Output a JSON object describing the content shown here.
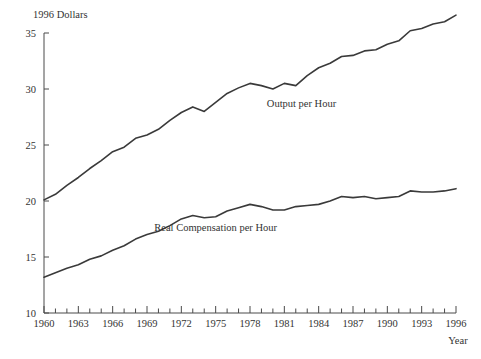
{
  "chart_data": {
    "type": "line",
    "title": "",
    "ylabel": "1996 Dollars",
    "xlabel": "Year",
    "xlim": [
      1960,
      1996
    ],
    "ylim": [
      10,
      35
    ],
    "grid": false,
    "legend_position": "inline-annotation",
    "y_ticks": [
      10,
      15,
      20,
      25,
      30,
      35
    ],
    "x_ticks": [
      1960,
      1961,
      1962,
      1963,
      1964,
      1965,
      1966,
      1967,
      1968,
      1969,
      1970,
      1971,
      1972,
      1973,
      1974,
      1975,
      1976,
      1977,
      1978,
      1979,
      1980,
      1981,
      1982,
      1983,
      1984,
      1985,
      1986,
      1987,
      1988,
      1989,
      1990,
      1991,
      1992,
      1993,
      1994,
      1995,
      1996
    ],
    "x_tick_labels": [
      "1960",
      "1963",
      "1966",
      "1969",
      "1972",
      "1975",
      "1978",
      "1981",
      "1984",
      "1987",
      "1990",
      "1993",
      "1996"
    ],
    "x_tick_label_years": [
      1960,
      1963,
      1966,
      1969,
      1972,
      1975,
      1978,
      1981,
      1984,
      1987,
      1990,
      1993,
      1996
    ],
    "x": [
      1960,
      1961,
      1962,
      1963,
      1964,
      1965,
      1966,
      1967,
      1968,
      1969,
      1970,
      1971,
      1972,
      1973,
      1974,
      1975,
      1976,
      1977,
      1978,
      1979,
      1980,
      1981,
      1982,
      1983,
      1984,
      1985,
      1986,
      1987,
      1988,
      1989,
      1990,
      1991,
      1992,
      1993,
      1994,
      1995,
      1996
    ],
    "series": [
      {
        "name": "Output per Hour",
        "label": "Output per Hour",
        "color": "#3a3a3a",
        "values": [
          20.1,
          20.6,
          21.4,
          22.1,
          22.9,
          23.6,
          24.4,
          24.8,
          25.6,
          25.9,
          26.4,
          27.2,
          27.9,
          28.4,
          28.0,
          28.8,
          29.6,
          30.1,
          30.5,
          30.3,
          30.0,
          30.5,
          30.3,
          31.2,
          31.9,
          32.3,
          32.9,
          33.0,
          33.4,
          33.5,
          34.0,
          34.3,
          35.2,
          35.4,
          35.8,
          36.0,
          36.6
        ]
      },
      {
        "name": "Real Compensation per Hour",
        "label": "Real Compensation per Hour",
        "color": "#3a3a3a",
        "values": [
          13.2,
          13.6,
          14.0,
          14.3,
          14.8,
          15.1,
          15.6,
          16.0,
          16.6,
          17.0,
          17.3,
          17.8,
          18.4,
          18.7,
          18.5,
          18.6,
          19.1,
          19.4,
          19.7,
          19.5,
          19.2,
          19.2,
          19.5,
          19.6,
          19.7,
          20.0,
          20.4,
          20.3,
          20.4,
          20.2,
          20.3,
          20.4,
          20.9,
          20.8,
          20.8,
          20.9,
          21.1
        ]
      }
    ],
    "annotations": [
      {
        "text": "Output per Hour",
        "x_year": 1982.5,
        "y_value": 28.4
      },
      {
        "text": "Real Compensation per Hour",
        "x_year": 1975.0,
        "y_value": 17.3
      }
    ]
  },
  "axis": {
    "y_axis_title": "1996 Dollars",
    "x_axis_title": "Year"
  },
  "colors": {
    "line": "#3a3a3a",
    "axis": "#4a4a4a",
    "text": "#333333",
    "background": "#ffffff"
  }
}
